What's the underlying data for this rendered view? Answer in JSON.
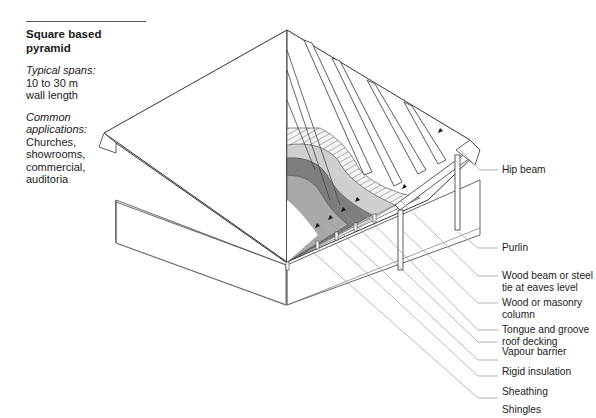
{
  "panel": {
    "title": "Square based pyramid",
    "spans": {
      "heading": "Typical spans:",
      "lines": [
        "10 to 30 m",
        "wall length"
      ]
    },
    "applications": {
      "heading": "Common applications:",
      "heading_lines": [
        "Common",
        "applications:"
      ],
      "lines": [
        "Churches,",
        "showrooms,",
        "commercial,",
        "auditoria"
      ]
    }
  },
  "callouts": [
    {
      "id": "hip-beam",
      "lines": [
        "Hip beam"
      ]
    },
    {
      "id": "purlin",
      "lines": [
        "Purlin"
      ]
    },
    {
      "id": "wood-beam",
      "lines": [
        "Wood beam or steel",
        "tie at eaves level"
      ]
    },
    {
      "id": "column",
      "lines": [
        "Wood or masonry",
        "column"
      ]
    },
    {
      "id": "decking",
      "lines": [
        "Tongue and groove",
        "roof decking"
      ]
    },
    {
      "id": "vapour-barrier",
      "lines": [
        "Vapour barrier"
      ]
    },
    {
      "id": "rigid-insulation",
      "lines": [
        "Rigid insulation"
      ]
    },
    {
      "id": "sheathing",
      "lines": [
        "Sheathing"
      ]
    },
    {
      "id": "shingles",
      "lines": [
        "Shingles"
      ]
    }
  ],
  "colors": {
    "line": "#333333",
    "leader": "#9a9a9a",
    "shingles": "#a8a8a8",
    "sheathing": "#7a7a7a",
    "insulation": "#c9c9c9",
    "decking_bg": "#f2f2f2"
  }
}
